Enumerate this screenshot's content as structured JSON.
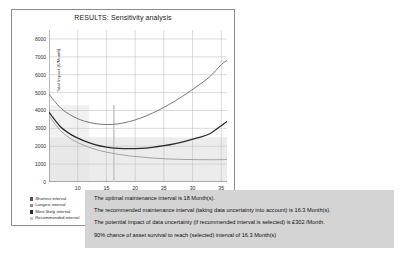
{
  "chart_data": {
    "type": "line",
    "title": "RESULTS: Sensitivity analysis",
    "xlabel": "",
    "ylabel": "Total Impact (£/Month)",
    "xlim": [
      5,
      36
    ],
    "ylim": [
      0,
      8500
    ],
    "grid": true,
    "legend_position": "below-left",
    "x_ticks": [
      10,
      15,
      20,
      25,
      30,
      35
    ],
    "y_ticks": [
      0,
      1000,
      2000,
      3000,
      4000,
      5000,
      6000,
      7000,
      8000
    ],
    "x": [
      5,
      7,
      9,
      11,
      13,
      15,
      17,
      19,
      21,
      23,
      25,
      27,
      29,
      31,
      33,
      35,
      36
    ],
    "series": [
      {
        "name": "Shortest interval",
        "color": "#555555",
        "values": [
          4900,
          4150,
          3700,
          3420,
          3270,
          3215,
          3250,
          3380,
          3580,
          3850,
          4170,
          4540,
          4950,
          5400,
          5890,
          6560,
          6800
        ]
      },
      {
        "name": "Longest interval",
        "color": "#8f8f8f",
        "values": [
          3700,
          2880,
          2380,
          2060,
          1830,
          1670,
          1550,
          1460,
          1400,
          1340,
          1300,
          1275,
          1260,
          1250,
          1245,
          1250,
          1260
        ]
      },
      {
        "name": "Most likely interval",
        "color": "#2b2b2b",
        "values": [
          3900,
          3090,
          2620,
          2310,
          2090,
          1950,
          1880,
          1860,
          1880,
          1940,
          2030,
          2150,
          2300,
          2480,
          2700,
          3150,
          3380
        ]
      },
      {
        "name": "Recommended interval",
        "color": "#c9c9c9",
        "type": "vertical-marker",
        "value": 16.3
      }
    ],
    "annotations": [
      {
        "name": "recommended-interval-marker",
        "x": 16.3,
        "label": "Recommended interval"
      }
    ]
  },
  "legend": {
    "items": [
      {
        "label": "Shortest interval",
        "color": "#555555"
      },
      {
        "label": "Longest interval",
        "color": "#8f8f8f"
      },
      {
        "label": "Most likely interval",
        "color": "#2b2b2b"
      },
      {
        "label": "Recommended interval",
        "color": "#c9c9c9"
      }
    ]
  },
  "results": {
    "lines": [
      "The optimal maintenance interval is 18 Month(s).",
      "The recommended maintenance interval (taking data uncertainty into account) is 16.3 Month(s).",
      "The potential impact of data uncertainty (if recommended interval is selected) is £302 /Month.",
      "90% chance of asset survival to reach (selected) interval of 16.3 Month(s)"
    ]
  }
}
